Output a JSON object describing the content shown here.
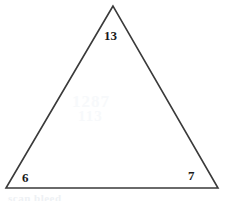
{
  "figure": {
    "type": "triangle-diagram",
    "background_color": "#ffffff",
    "stroke_color": "#3a3a3a",
    "label_color": "#1a1a1a",
    "geometry": {
      "apex": {
        "x": 113,
        "y": 6
      },
      "bottom_left": {
        "x": 6,
        "y": 188
      },
      "bottom_right": {
        "x": 218,
        "y": 188
      },
      "points": "113,6 6,188 218,188"
    },
    "labels": {
      "apex": "13",
      "bottom_left": "6",
      "bottom_right": "7"
    },
    "artifacts": {
      "center_ghost_line_1": "1287",
      "center_ghost_line_2": "113",
      "bottom_ghost": "scan bleed"
    }
  }
}
